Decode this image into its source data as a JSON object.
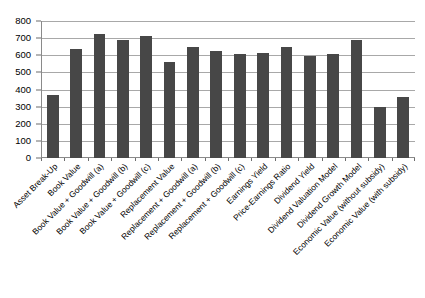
{
  "chart_data": {
    "type": "bar",
    "title": "",
    "subtitle": "",
    "xlabel": "",
    "ylabel": "",
    "ylim": [
      0,
      800
    ],
    "ytick_step": 100,
    "yticks": [
      0,
      100,
      200,
      300,
      400,
      500,
      600,
      700,
      800
    ],
    "ytick_labels": [
      "0",
      "100",
      "200",
      "300",
      "400",
      "500",
      "600",
      "700",
      "800"
    ],
    "grid": true,
    "grid_orientation": "horizontal",
    "legend": false,
    "legend_position": "none",
    "bar_color": "#474747",
    "plot_background": "#ffffff",
    "categories": [
      "Asset Break-Up",
      "Book Value",
      "Book Value + Goodwill (a)",
      "Book Value + Goodwill (b)",
      "Book Value + Goodwill (c)",
      "Replacement Value",
      "Replacement + Goodwill (a)",
      "Replacement + Goodwill (b)",
      "Replacement + Goodwill (c)",
      "Earnings Yield",
      "Price-Earnings Ratio",
      "Dividend Yield",
      "Dividend Valuation Model",
      "Dividend Growth Model",
      "Economic Value (without subsidy)",
      "Economic Value (with subsidy)"
    ],
    "values": [
      368,
      638,
      723,
      690,
      715,
      558,
      648,
      625,
      605,
      612,
      648,
      598,
      608,
      688,
      298,
      358
    ],
    "series": [
      {
        "name": "Valuation",
        "values": [
          368,
          638,
          723,
          690,
          715,
          558,
          648,
          625,
          605,
          612,
          648,
          598,
          608,
          688,
          298,
          358
        ]
      }
    ]
  },
  "axis": {
    "y_min_label": "0",
    "y_max_label": "800"
  }
}
